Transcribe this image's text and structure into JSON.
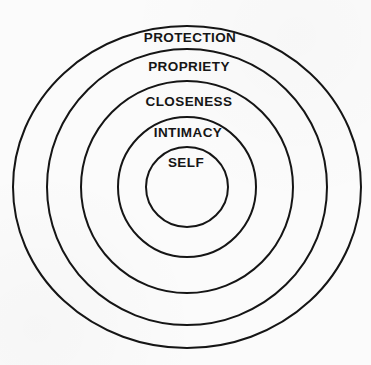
{
  "diagram": {
    "type": "concentric-circles",
    "rings": [
      {
        "label": "PROTECTION"
      },
      {
        "label": "PROPRIETY"
      },
      {
        "label": "CLOSENESS"
      },
      {
        "label": "INTIMACY"
      },
      {
        "label": "SELF"
      }
    ],
    "colors": {
      "stroke": "#151515",
      "text": "#151515",
      "background": "#fbfbfb"
    }
  }
}
